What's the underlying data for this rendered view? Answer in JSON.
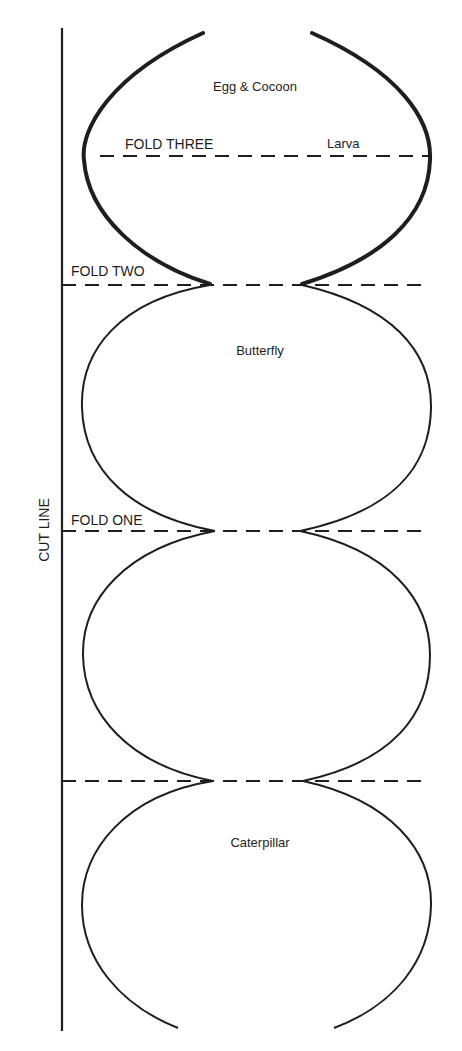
{
  "diagram": {
    "stroke_color": "#1e1e1e",
    "background": "#ffffff",
    "cut_line_label": "CUT LINE",
    "folds": [
      {
        "id": "fold-three",
        "label": "FOLD THREE"
      },
      {
        "id": "fold-two",
        "label": "FOLD TWO"
      },
      {
        "id": "fold-one",
        "label": "FOLD ONE"
      },
      {
        "id": "fold-base",
        "label": ""
      }
    ],
    "segments": [
      {
        "id": "top",
        "labels": [
          "Egg & Cocoon",
          "Larva"
        ],
        "stroke": "bold"
      },
      {
        "id": "second",
        "labels": [
          "Butterfly"
        ],
        "stroke": "thin"
      },
      {
        "id": "third",
        "labels": [],
        "stroke": "thin"
      },
      {
        "id": "bottom",
        "labels": [
          "Caterpillar"
        ],
        "stroke": "thin"
      }
    ]
  }
}
